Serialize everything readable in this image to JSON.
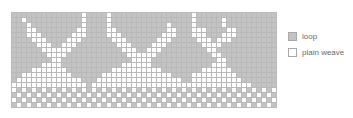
{
  "grid": {
    "columns": 53,
    "rows": 19,
    "cell_size_px": 5,
    "cell_types": {
      "1": "loop",
      "0": "plain weave"
    },
    "colors": {
      "loop": "#c3c3c3",
      "plain_weave": "#ffffff",
      "gridline": "#b9b9b9"
    },
    "cells": [
      "11111111111111011110111111111111111101111111111111111",
      "11011111111111011110111111111111111101111101111111111",
      "11101111111111011110111111111110111101111101111111111",
      "11100111111110011110011111111110011100011110011111111",
      "11100011111100011110001111111100011100011100011111111",
      "11110001111000111111000111111000111110001000111111111",
      "11111000110001111111100011110001111111000011111111111",
      "11111100000011111111110001100011111111100111111111111",
      "11111110000111111111111000000111111111110011111111111",
      "11111111001111111111111100001111111111111001111111111",
      "11111100001111111111110000001111111111110001111111111",
      "11110000000111111111000000000011111111000000111111111",
      "11000000000011111100000000000000111100000000011111111",
      "10000000000000111000000000000000001100000000001111111",
      "00000000000000010000000000000000000000000000000011111",
      "01010101010101010101010101010101010101010101010101010",
      "10101010101010101010101010101010101010101010101010101",
      "01010101010101010101010101010101010101010101010101010",
      "10101010101010101010101010101010101010101010101010101"
    ]
  },
  "legend": {
    "items": [
      {
        "label": "loop",
        "swatch": "loop"
      },
      {
        "label": "plain weave",
        "swatch": "plain"
      }
    ]
  }
}
